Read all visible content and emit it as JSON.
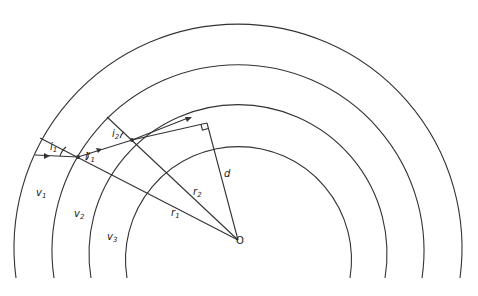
{
  "diagram": {
    "type": "ray refraction through concentric spherical layers",
    "center_label": "O",
    "layers": [
      {
        "label": "v",
        "sub": "1"
      },
      {
        "label": "v",
        "sub": "2"
      },
      {
        "label": "v",
        "sub": "3"
      }
    ],
    "angles": [
      {
        "label": "i",
        "sub": "1"
      },
      {
        "label": "i'",
        "sub": "1"
      },
      {
        "label": "i",
        "sub": "2"
      }
    ],
    "radii": [
      {
        "label": "r",
        "sub": "1"
      },
      {
        "label": "r",
        "sub": "2"
      }
    ],
    "distance_label": "d"
  }
}
